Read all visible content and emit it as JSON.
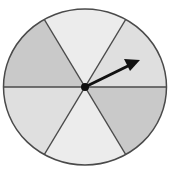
{
  "spinner": {
    "sector_count": 6,
    "sectors": [
      {
        "name": "top",
        "fill": "#ececec"
      },
      {
        "name": "upper-right",
        "fill": "#dfdfdf"
      },
      {
        "name": "lower-right",
        "fill": "#c9c9c9"
      },
      {
        "name": "bottom",
        "fill": "#ececec"
      },
      {
        "name": "lower-left",
        "fill": "#dfdfdf"
      },
      {
        "name": "upper-left",
        "fill": "#c9c9c9"
      }
    ],
    "outline_color": "#4a4a4a",
    "arrow_color": "#111111",
    "arrow_points_to": "upper-right"
  }
}
